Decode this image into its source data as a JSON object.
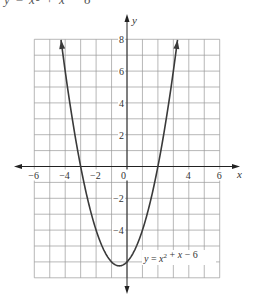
{
  "caption_fragment": "y = x² + x − 6",
  "chart_data": {
    "type": "line",
    "title": "",
    "function": "y = x^2 + x - 6",
    "label": "y = x² + x − 6",
    "xlabel": "x",
    "ylabel": "y",
    "xlim": [
      -6,
      6
    ],
    "ylim": [
      -7,
      8
    ],
    "grid": true,
    "grid_step": 1,
    "x_ticks": [
      -6,
      -4,
      -2,
      0,
      4,
      6
    ],
    "x_tick_labels": [
      "−6",
      "−4",
      "−2",
      "0",
      "4",
      "6"
    ],
    "y_ticks": [
      8,
      6,
      4,
      2,
      -2,
      -4
    ],
    "y_tick_labels": [
      "8",
      "6",
      "4",
      "2",
      "−2",
      "−4"
    ],
    "vertex": [
      -0.5,
      -6.25
    ],
    "roots": [
      -3,
      2
    ],
    "y_intercept": -6,
    "series": [
      {
        "name": "y = x² + x − 6",
        "x": [
          -4.27,
          -4,
          -3.5,
          -3,
          -2.5,
          -2,
          -1.5,
          -1,
          -0.5,
          0,
          0.5,
          1,
          1.5,
          2,
          2.5,
          3,
          3.27
        ],
        "y": [
          8,
          6,
          2.75,
          0,
          -2.25,
          -4,
          -5.25,
          -6,
          -6.25,
          -6,
          -5.25,
          -4,
          -2.25,
          0,
          2.75,
          6,
          8
        ]
      }
    ],
    "colors": {
      "curve": "#3a3a3a",
      "grid": "#9a9a9a",
      "axis": "#222222"
    }
  }
}
